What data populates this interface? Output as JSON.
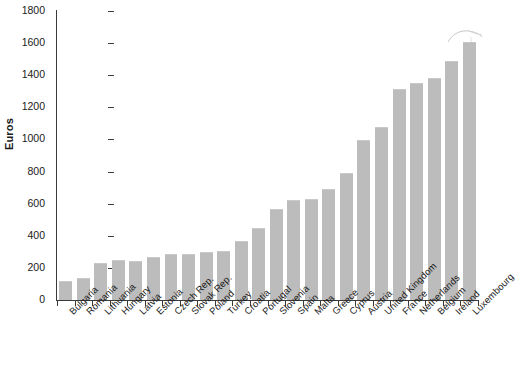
{
  "chart_data": {
    "type": "bar",
    "title": "",
    "xlabel": "",
    "ylabel": "Euros",
    "ylim": [
      0,
      1800
    ],
    "ytick_step": 200,
    "yticks": [
      0,
      200,
      400,
      600,
      800,
      1000,
      1200,
      1400,
      1600,
      1800
    ],
    "grid": false,
    "legend": null,
    "bar_color": "#bcbcbc",
    "axis_color": "#3a3a3a",
    "categories": [
      "Bulgaria",
      "Romania",
      "Lithuania",
      "Hungary",
      "Latvia",
      "Estonia",
      "Czech Rep.",
      "Slovak Rep.",
      "Poland",
      "Turkey",
      "Croatia",
      "Portugal",
      "Slovenia",
      "Spain",
      "Malta",
      "Greece",
      "Cyprus",
      "Austria",
      "United Kingdom",
      "France",
      "Netherlands",
      "Belgium",
      "Ireland",
      "Luxembourg"
    ],
    "values": [
      120,
      140,
      230,
      248,
      246,
      270,
      288,
      286,
      297,
      308,
      368,
      447,
      568,
      620,
      632,
      693,
      790,
      995,
      1075,
      1316,
      1352,
      1384,
      1490,
      1610
    ]
  },
  "artifact": {
    "name": "scan-smudge"
  }
}
